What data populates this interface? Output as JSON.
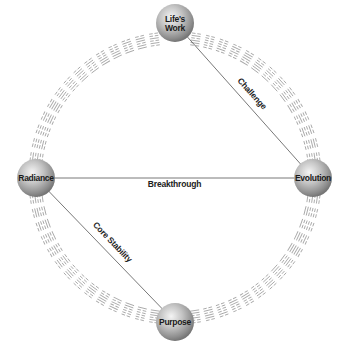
{
  "diagram": {
    "type": "circular-relationship-diagram",
    "center": {
      "x": 175,
      "y": 178
    },
    "ring_radius": 140,
    "node_radius": 19,
    "colors": {
      "sphere_highlight": "#f2f2f2",
      "sphere_mid": "#b5b5b5",
      "sphere_edge": "#7a7a7a",
      "edge_line": "#555555",
      "hexagram": "#a8a8a8",
      "text": "#1a1a1a"
    },
    "nodes": [
      {
        "id": "lifes-work",
        "label_lines": [
          "Life's",
          "Work"
        ],
        "x": 175,
        "y": 23
      },
      {
        "id": "radiance",
        "label_lines": [
          "Radiance"
        ],
        "x": 36,
        "y": 178
      },
      {
        "id": "evolution",
        "label_lines": [
          "Evolution"
        ],
        "x": 313,
        "y": 178
      },
      {
        "id": "purpose",
        "label_lines": [
          "Purpose"
        ],
        "x": 175,
        "y": 322
      }
    ],
    "edges": [
      {
        "from": "lifes-work",
        "to": "evolution",
        "label": "Challenge"
      },
      {
        "from": "radiance",
        "to": "evolution",
        "label": "Breakthrough"
      },
      {
        "from": "radiance",
        "to": "purpose",
        "label": "Core Stability"
      }
    ],
    "ring": {
      "symbol": "hexagram",
      "count": 64,
      "style": "I Ching hexagrams of six solid/broken lines arranged around the circle"
    }
  }
}
